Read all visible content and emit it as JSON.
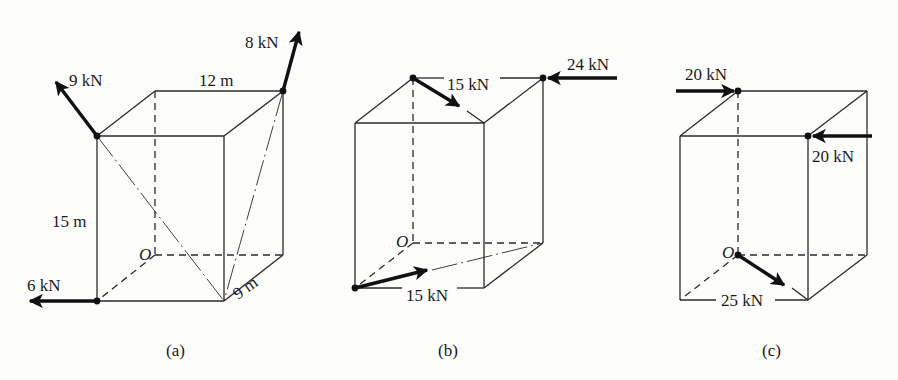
{
  "figure": {
    "panels": [
      {
        "id": "a",
        "caption": "(a)",
        "origin_label": "O",
        "dimensions": {
          "width": "12 m",
          "height": "15 m",
          "depth": "9 m"
        },
        "forces": [
          {
            "label": "9 kN",
            "direction": "up-left along diagonal"
          },
          {
            "label": "8 kN",
            "direction": "up along diagonal"
          },
          {
            "label": "6 kN",
            "direction": "left"
          }
        ]
      },
      {
        "id": "b",
        "caption": "(b)",
        "origin_label": "O",
        "forces": [
          {
            "label": "15 kN",
            "position": "top"
          },
          {
            "label": "24 kN",
            "direction": "left"
          },
          {
            "label": "15 kN",
            "position": "bottom"
          }
        ]
      },
      {
        "id": "c",
        "caption": "(c)",
        "origin_label": "O",
        "forces": [
          {
            "label": "20 kN",
            "direction": "right",
            "position": "top-back"
          },
          {
            "label": "20 kN",
            "direction": "left",
            "position": "top-front"
          },
          {
            "label": "25 kN",
            "position": "bottom"
          }
        ]
      }
    ],
    "colors": {
      "line": "#2a2a2a",
      "arrow": "#111111",
      "background": "#fdfdfc"
    }
  }
}
